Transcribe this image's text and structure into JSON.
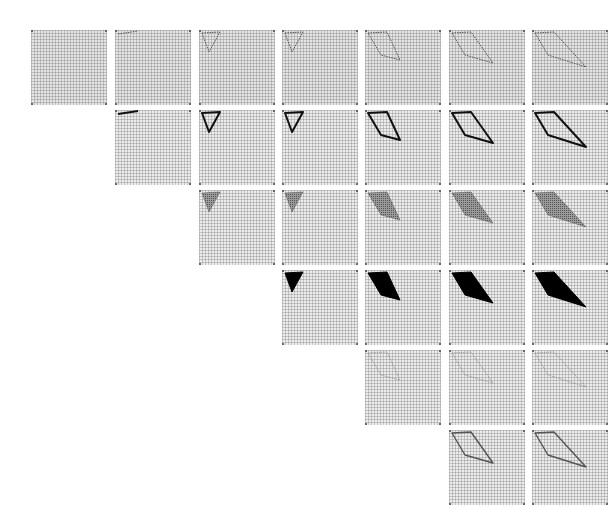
{
  "figure": {
    "col_x": [
      31,
      115,
      199,
      282,
      365,
      449,
      532
    ],
    "row_y": [
      30,
      110,
      190,
      270,
      350,
      430
    ],
    "shapes": {
      "empty": "",
      "line": "3,4 23,1",
      "triangle": "3,3 21,2 10,22",
      "quad_a": "3,3 22,2 35,30 16,25",
      "quad_b": "3,3 22,2 44,33 16,25",
      "quad_c": "3,3 22,2 54,37 16,25"
    },
    "rows": [
      {
        "row": 1,
        "style": "dotted",
        "start_col": 0,
        "cells": [
          "empty",
          "line",
          "triangle",
          "triangle",
          "quad_a",
          "quad_b",
          "quad_c"
        ]
      },
      {
        "row": 2,
        "style": "bold-outline",
        "start_col": 1,
        "cells": [
          "line",
          "triangle",
          "triangle",
          "quad_a",
          "quad_b",
          "quad_c"
        ]
      },
      {
        "row": 3,
        "style": "hatched-fill",
        "start_col": 2,
        "cells": [
          "triangle",
          "triangle",
          "quad_a",
          "quad_b",
          "quad_c"
        ]
      },
      {
        "row": 4,
        "style": "solid-fill",
        "start_col": 3,
        "cells": [
          "triangle",
          "quad_a",
          "quad_b",
          "quad_c"
        ]
      },
      {
        "row": 5,
        "style": "thin-dotted",
        "start_col": 4,
        "cells": [
          "quad_a",
          "quad_b",
          "quad_c"
        ]
      },
      {
        "row": 6,
        "style": "gray-outline",
        "start_col": 5,
        "cells": [
          "quad_b",
          "quad_c"
        ]
      }
    ]
  }
}
